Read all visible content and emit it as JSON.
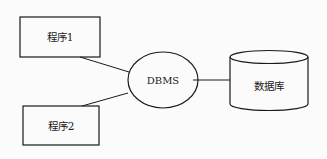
{
  "diagram": {
    "nodes": [
      {
        "id": "program1",
        "label": "程序1",
        "shape": "rectangle"
      },
      {
        "id": "program2",
        "label": "程序2",
        "shape": "rectangle"
      },
      {
        "id": "dbms",
        "label": "DBMS",
        "shape": "ellipse"
      },
      {
        "id": "database",
        "label": "数据库",
        "shape": "cylinder"
      }
    ],
    "edges": [
      {
        "from": "program1",
        "to": "dbms"
      },
      {
        "from": "program2",
        "to": "dbms"
      },
      {
        "from": "dbms",
        "to": "database"
      }
    ],
    "stroke_color": "#1a1a1a",
    "background": "#fbfbfb"
  }
}
